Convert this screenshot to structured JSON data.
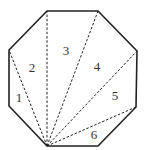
{
  "diagram": {
    "stroke_color": "#222222",
    "background": "#ffffff",
    "octagon_vertices": [
      [
        47,
        11
      ],
      [
        98,
        11
      ],
      [
        137,
        51
      ],
      [
        136,
        107
      ],
      [
        98,
        146
      ],
      [
        47,
        146
      ],
      [
        9,
        106
      ],
      [
        9,
        50
      ]
    ],
    "origin_vertex": [
      47,
      146
    ],
    "diagonal_targets": [
      [
        9,
        50
      ],
      [
        47,
        11
      ],
      [
        98,
        11
      ],
      [
        137,
        51
      ],
      [
        136,
        107
      ]
    ],
    "regions": [
      {
        "label": "1",
        "x": 19,
        "y": 99
      },
      {
        "label": "2",
        "x": 32,
        "y": 69
      },
      {
        "label": "3",
        "x": 66,
        "y": 52
      },
      {
        "label": "4",
        "x": 97,
        "y": 68
      },
      {
        "label": "5",
        "x": 115,
        "y": 97
      },
      {
        "label": "6",
        "x": 94,
        "y": 136
      }
    ]
  }
}
